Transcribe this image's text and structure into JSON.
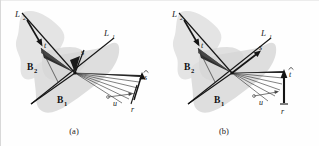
{
  "figure": {
    "caption_a": "(a)",
    "caption_b": "(b)",
    "background_color": "#fefefe",
    "blob_color": "#e2e2e2",
    "blob_color_dark": "#d5d5d5",
    "line_color": "#1a1a1a",
    "ray_color": "#2b2b2b",
    "fan_fill": "#3a3a3a"
  },
  "panel_a": {
    "labels": {
      "line2": "L",
      "line2_sub": "2",
      "line1": "L",
      "line1_sub": "1",
      "body2": "B",
      "body2_sub": "2",
      "body1": "B",
      "body1_sub": "1",
      "vec_t": "t",
      "vec_s": "s",
      "vec_u": "u",
      "vec_r": "r",
      "vec_shat": "s"
    }
  },
  "panel_b": {
    "labels": {
      "line2": "L",
      "line2_sub": "2",
      "line1": "L",
      "line1_sub": "1",
      "body2": "B",
      "body2_sub": "2",
      "body1": "B",
      "body1_sub": "1",
      "vec_t": "t",
      "vec_s": "s",
      "vec_u": "u",
      "vec_r": "r",
      "vec_that": "t"
    }
  }
}
